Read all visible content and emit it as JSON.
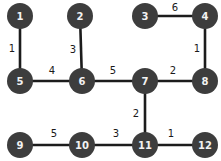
{
  "chart_data": {
    "type": "diagram",
    "title": "",
    "subtitle": "",
    "xlabel": "",
    "ylabel": "",
    "graph_kind": "undirected-weighted-graph",
    "layout": "grid",
    "canvas": {
      "width": 221,
      "height": 161,
      "background": "#ffffff"
    },
    "style": {
      "node_fill": "#3d3d3d",
      "node_text": "#f2f2f2",
      "edge_color": "#1c1c1c",
      "weight_text": "#1a1a1a",
      "node_radius": 13,
      "edge_width": 2.6
    },
    "nodes": [
      {
        "id": "1",
        "label": "1",
        "x": 20,
        "y": 16
      },
      {
        "id": "2",
        "label": "2",
        "x": 80,
        "y": 16
      },
      {
        "id": "3",
        "label": "3",
        "x": 145,
        "y": 16
      },
      {
        "id": "4",
        "label": "4",
        "x": 205,
        "y": 16
      },
      {
        "id": "5",
        "label": "5",
        "x": 20,
        "y": 81
      },
      {
        "id": "6",
        "label": "6",
        "x": 82,
        "y": 81
      },
      {
        "id": "7",
        "label": "7",
        "x": 145,
        "y": 81
      },
      {
        "id": "8",
        "label": "8",
        "x": 205,
        "y": 81
      },
      {
        "id": "9",
        "label": "9",
        "x": 20,
        "y": 145
      },
      {
        "id": "10",
        "label": "10",
        "x": 82,
        "y": 145
      },
      {
        "id": "11",
        "label": "11",
        "x": 145,
        "y": 145
      },
      {
        "id": "12",
        "label": "12",
        "x": 205,
        "y": 145
      }
    ],
    "edges": [
      {
        "source": "1",
        "target": "5",
        "weight": 1,
        "label": "1",
        "label_x": 12,
        "label_y": 48,
        "orientation": "vertical"
      },
      {
        "source": "2",
        "target": "6",
        "weight": 3,
        "label": "3",
        "label_x": 73,
        "label_y": 49,
        "orientation": "vertical"
      },
      {
        "source": "3",
        "target": "4",
        "weight": 6,
        "label": "6",
        "label_x": 175,
        "label_y": 7,
        "orientation": "horizontal"
      },
      {
        "source": "4",
        "target": "8",
        "weight": 1,
        "label": "1",
        "label_x": 197,
        "label_y": 48,
        "orientation": "vertical"
      },
      {
        "source": "5",
        "target": "6",
        "weight": 4,
        "label": "4",
        "label_x": 52,
        "label_y": 70,
        "orientation": "horizontal"
      },
      {
        "source": "6",
        "target": "7",
        "weight": 5,
        "label": "5",
        "label_x": 113,
        "label_y": 70,
        "orientation": "horizontal"
      },
      {
        "source": "7",
        "target": "8",
        "weight": 2,
        "label": "2",
        "label_x": 173,
        "label_y": 70,
        "orientation": "horizontal"
      },
      {
        "source": "7",
        "target": "11",
        "weight": 2,
        "label": "2",
        "label_x": 136,
        "label_y": 113,
        "orientation": "vertical"
      },
      {
        "source": "9",
        "target": "10",
        "weight": 5,
        "label": "5",
        "label_x": 54,
        "label_y": 133,
        "orientation": "horizontal"
      },
      {
        "source": "10",
        "target": "11",
        "weight": 3,
        "label": "3",
        "label_x": 116,
        "label_y": 133,
        "orientation": "horizontal"
      },
      {
        "source": "11",
        "target": "12",
        "weight": 1,
        "label": "1",
        "label_x": 171,
        "label_y": 133,
        "orientation": "horizontal"
      }
    ]
  }
}
